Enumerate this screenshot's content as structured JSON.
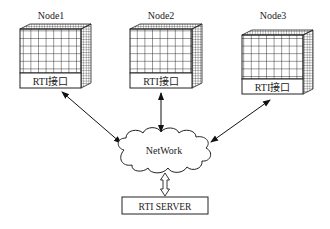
{
  "diagram": {
    "nodes": [
      {
        "id": "node1",
        "title": "Node1",
        "interface_label": "RTI接口"
      },
      {
        "id": "node2",
        "title": "Node2",
        "interface_label": "RTI接口"
      },
      {
        "id": "node3",
        "title": "Node3",
        "interface_label": "RTI接口"
      }
    ],
    "network": {
      "label": "NetWork"
    },
    "server": {
      "label": "RTI SERVER"
    },
    "edges": [
      {
        "from": "node1",
        "to": "network",
        "type": "bidirectional-arrow"
      },
      {
        "from": "node2",
        "to": "network",
        "type": "bidirectional-arrow"
      },
      {
        "from": "node3",
        "to": "network",
        "type": "bidirectional-arrow"
      },
      {
        "from": "network",
        "to": "server",
        "type": "bidirectional-hollow-arrow"
      }
    ]
  }
}
